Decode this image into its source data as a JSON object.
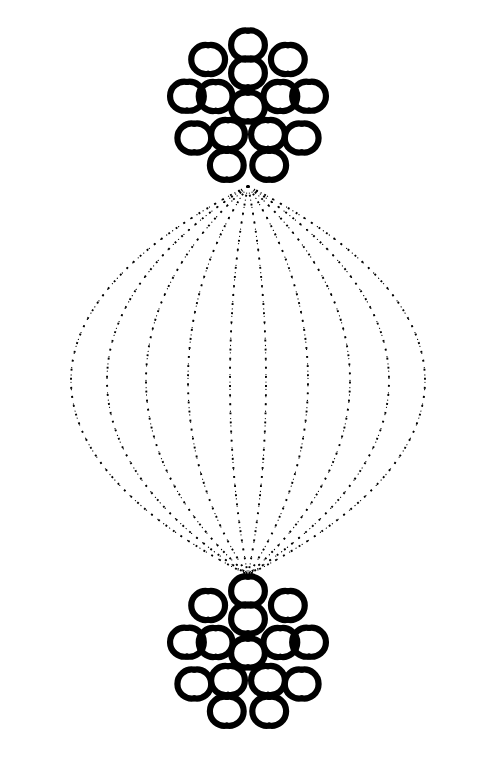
{
  "figure": {
    "title": "Ornamental double-rosette diagram",
    "description": "Two identical circular rosettes, one near the top and one near the bottom, joined by ten dotted curved lines that bow outward to form a lens (vesica) shape.",
    "canvas": {
      "width": 504,
      "height": 761
    },
    "background_color": "#ffffff",
    "ink_color": "#000000"
  },
  "motif": {
    "name": "crescent-pair",
    "label": "Paired opposing crescents forming a lens",
    "stroke_color": "#000000",
    "unit_radius": 14.5,
    "arc_thickness": 6.2,
    "arc_sweep_degrees": 200,
    "gap_between_crescents": 2.4,
    "count_per_rosette": 15
  },
  "rosettes": [
    {
      "id": "rosette-top",
      "label": "Top rosette",
      "center": {
        "x": 248,
        "y": 107
      },
      "rings": [
        {
          "id": "top-center",
          "label": "Center motif",
          "count": 1,
          "radius": 0,
          "start_angle": 0,
          "motif_rotation": 0
        },
        {
          "id": "top-inner",
          "label": "Inner ring",
          "count": 5,
          "radius": 34,
          "start_angle": -90,
          "motif_rotation": 0
        },
        {
          "id": "top-outer",
          "label": "Outer ring",
          "count": 9,
          "radius": 62,
          "start_angle": -90,
          "motif_rotation": 0
        }
      ]
    },
    {
      "id": "rosette-bottom",
      "label": "Bottom rosette",
      "center": {
        "x": 248,
        "y": 653
      },
      "rings": [
        {
          "id": "bottom-center",
          "label": "Center motif",
          "count": 1,
          "radius": 0,
          "start_angle": 0,
          "motif_rotation": 0
        },
        {
          "id": "bottom-inner",
          "label": "Inner ring",
          "count": 5,
          "radius": 34,
          "start_angle": -90,
          "motif_rotation": 0
        },
        {
          "id": "bottom-outer",
          "label": "Outer ring",
          "count": 9,
          "radius": 62,
          "start_angle": -90,
          "motif_rotation": 0
        }
      ]
    }
  ],
  "connectors": {
    "label": "Dotted connecting curves",
    "style": "dotted",
    "dot_color": "#000000",
    "dot_size": 1.9,
    "dot_spacing": 7.2,
    "stroke_width": 1.2,
    "top_anchor": {
      "x": 248,
      "y": 186
    },
    "bottom_anchor": {
      "x": 248,
      "y": 575
    },
    "curves": [
      {
        "id": "curve-l5",
        "side": "left",
        "midline_x": 12,
        "bulge": 236
      },
      {
        "id": "curve-l4",
        "side": "left",
        "midline_x": 60,
        "bulge": 188
      },
      {
        "id": "curve-l3",
        "side": "left",
        "midline_x": 112,
        "bulge": 136
      },
      {
        "id": "curve-l2",
        "side": "left",
        "midline_x": 168,
        "bulge": 80
      },
      {
        "id": "curve-l1",
        "side": "left",
        "midline_x": 224,
        "bulge": 24
      },
      {
        "id": "curve-r1",
        "side": "right",
        "midline_x": 272,
        "bulge": 24
      },
      {
        "id": "curve-r2",
        "side": "right",
        "midline_x": 328,
        "bulge": 80
      },
      {
        "id": "curve-r3",
        "side": "right",
        "midline_x": 384,
        "bulge": 136
      },
      {
        "id": "curve-r4",
        "side": "right",
        "midline_x": 436,
        "bulge": 188
      },
      {
        "id": "curve-r5",
        "side": "right",
        "midline_x": 488,
        "bulge": 236
      }
    ]
  },
  "chart_data": {
    "type": "diagram",
    "title": "Ornamental double-rosette diagram",
    "nodes": [
      {
        "name": "Top rosette",
        "x": 248,
        "y": 107,
        "motifs": 15
      },
      {
        "name": "Bottom rosette",
        "x": 248,
        "y": 653,
        "motifs": 15
      }
    ],
    "edges": 10,
    "edge_style": "dotted curved",
    "symmetry": "bilateral vertical mirror"
  }
}
